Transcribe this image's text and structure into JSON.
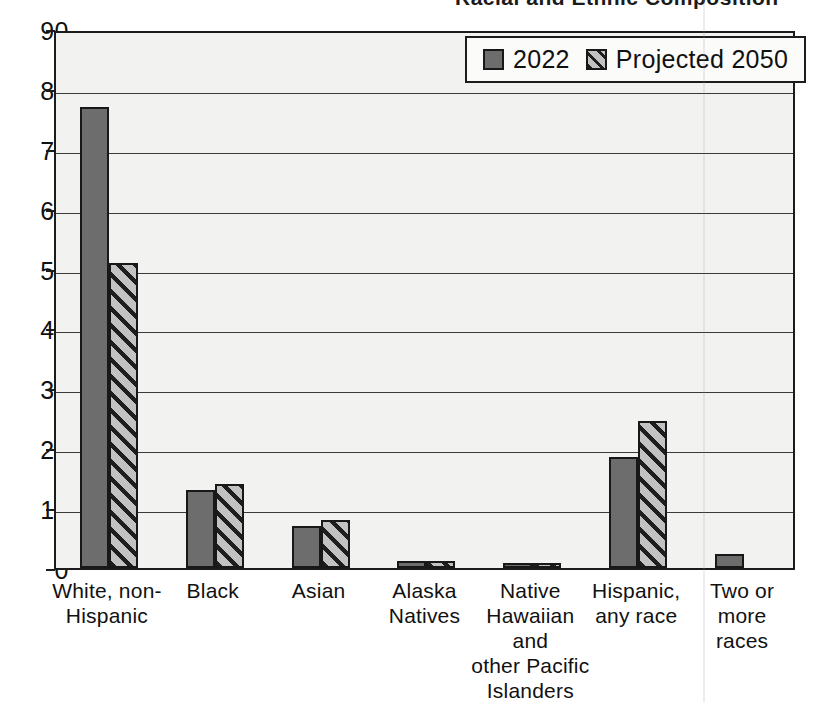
{
  "chart_data": {
    "type": "bar",
    "title": "Racial and Ethnic Composition",
    "xlabel": "",
    "ylabel": "",
    "ylim": [
      0,
      90
    ],
    "ytick_step": 10,
    "yticks": [
      "90",
      "80",
      "70",
      "60",
      "50",
      "40",
      "30",
      "20",
      "10",
      "0"
    ],
    "grid": true,
    "legend_position": "top-right",
    "categories": [
      "White, non-Hispanic",
      "Black",
      "Asian",
      "Alaska Natives",
      "Native Hawaiian and other Pacific Islanders",
      "Hispanic, any race",
      "Two or more races"
    ],
    "category_label_lines": [
      [
        "White, non-",
        "Hispanic"
      ],
      [
        "Black"
      ],
      [
        "Asian"
      ],
      [
        "Alaska",
        "Natives"
      ],
      [
        "Native",
        "Hawaiian",
        "and",
        "other Pacific",
        "Islanders"
      ],
      [
        "Hispanic,",
        "any race"
      ],
      [
        "Two or",
        "more",
        "races"
      ]
    ],
    "series": [
      {
        "name": "2022",
        "values": [
          77,
          13,
          7,
          1.2,
          0.8,
          18.5,
          2.3
        ]
      },
      {
        "name": "Projected 2050",
        "values": [
          51,
          14,
          8,
          1.2,
          0.8,
          24.5,
          null
        ]
      }
    ]
  },
  "legend": {
    "items": [
      {
        "label": "2022",
        "pattern": "solid"
      },
      {
        "label": "Projected 2050",
        "pattern": "hatch"
      }
    ]
  },
  "colors": {
    "bar_solid": "#6d6d6d",
    "bar_hatch_background": "#b9b9b9",
    "bar_hatch_line": "#1e1e1e",
    "plot_background": "#f2f2f0",
    "axis": "#1c1c1c",
    "gridline": "#3a3a3a",
    "text": "#111111"
  }
}
